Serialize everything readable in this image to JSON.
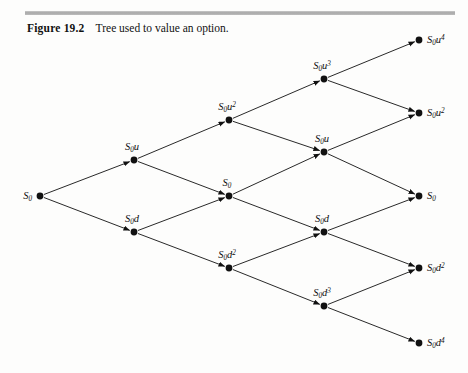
{
  "figure": {
    "label": "Figure 19.2",
    "caption": "Tree used to value an option.",
    "rule_color": "#b4b4b4",
    "background_color": "#fdfdfc",
    "ink_color": "#111111"
  },
  "diagram": {
    "type": "binomial-tree",
    "steps": 4,
    "recombining": true,
    "node_radius": 3.4,
    "arrowheads": true,
    "nodes": [
      {
        "id": "n0",
        "step": 0,
        "level": 0,
        "base": "S",
        "sub": "0",
        "exp": "",
        "label": "S0",
        "x": 40,
        "y": 196,
        "label_pos": "left"
      },
      {
        "id": "u1",
        "step": 1,
        "level": 1,
        "base": "S",
        "sub": "0",
        "exp": "u",
        "label": "S0u",
        "x": 134,
        "y": 160,
        "label_pos": "above"
      },
      {
        "id": "d1",
        "step": 1,
        "level": -1,
        "base": "S",
        "sub": "0",
        "exp": "d",
        "label": "S0d",
        "x": 134,
        "y": 232,
        "label_pos": "above"
      },
      {
        "id": "u2",
        "step": 2,
        "level": 2,
        "base": "S",
        "sub": "0",
        "exp": "u2",
        "label": "S0u2",
        "x": 229,
        "y": 120,
        "label_pos": "above"
      },
      {
        "id": "m2",
        "step": 2,
        "level": 0,
        "base": "S",
        "sub": "0",
        "exp": "",
        "label": "S0",
        "x": 229,
        "y": 196,
        "label_pos": "above"
      },
      {
        "id": "d2",
        "step": 2,
        "level": -2,
        "base": "S",
        "sub": "0",
        "exp": "d2",
        "label": "S0d2",
        "x": 229,
        "y": 268,
        "label_pos": "above"
      },
      {
        "id": "u3",
        "step": 3,
        "level": 3,
        "base": "S",
        "sub": "0",
        "exp": "u3",
        "label": "S0u3",
        "x": 324,
        "y": 79,
        "label_pos": "above"
      },
      {
        "id": "um3",
        "step": 3,
        "level": 1,
        "base": "S",
        "sub": "0",
        "exp": "u",
        "label": "S0u",
        "x": 324,
        "y": 152,
        "label_pos": "above"
      },
      {
        "id": "dm3",
        "step": 3,
        "level": -1,
        "base": "S",
        "sub": "0",
        "exp": "d",
        "label": "S0d",
        "x": 324,
        "y": 232,
        "label_pos": "above"
      },
      {
        "id": "d3",
        "step": 3,
        "level": -3,
        "base": "S",
        "sub": "0",
        "exp": "d3",
        "label": "S0d3",
        "x": 324,
        "y": 306,
        "label_pos": "above"
      },
      {
        "id": "t4u4",
        "step": 4,
        "level": 4,
        "base": "S",
        "sub": "0",
        "exp": "u4",
        "label": "S0u4",
        "x": 419,
        "y": 40,
        "label_pos": "right"
      },
      {
        "id": "t4u2",
        "step": 4,
        "level": 2,
        "base": "S",
        "sub": "0",
        "exp": "u2",
        "label": "S0u2",
        "x": 419,
        "y": 113,
        "label_pos": "right"
      },
      {
        "id": "t4m",
        "step": 4,
        "level": 0,
        "base": "S",
        "sub": "0",
        "exp": "",
        "label": "S0",
        "x": 419,
        "y": 196,
        "label_pos": "right"
      },
      {
        "id": "t4d2",
        "step": 4,
        "level": -2,
        "base": "S",
        "sub": "0",
        "exp": "d2",
        "label": "S0d2",
        "x": 419,
        "y": 268,
        "label_pos": "right"
      },
      {
        "id": "t4d4",
        "step": 4,
        "level": -4,
        "base": "S",
        "sub": "0",
        "exp": "d4",
        "label": "S0d4",
        "x": 419,
        "y": 343,
        "label_pos": "right"
      }
    ],
    "edges": [
      {
        "from": "n0",
        "to": "u1",
        "move": "up"
      },
      {
        "from": "n0",
        "to": "d1",
        "move": "down"
      },
      {
        "from": "u1",
        "to": "u2",
        "move": "up"
      },
      {
        "from": "u1",
        "to": "m2",
        "move": "down"
      },
      {
        "from": "d1",
        "to": "m2",
        "move": "up"
      },
      {
        "from": "d1",
        "to": "d2",
        "move": "down"
      },
      {
        "from": "u2",
        "to": "u3",
        "move": "up"
      },
      {
        "from": "u2",
        "to": "um3",
        "move": "down"
      },
      {
        "from": "m2",
        "to": "um3",
        "move": "up"
      },
      {
        "from": "m2",
        "to": "dm3",
        "move": "down"
      },
      {
        "from": "d2",
        "to": "dm3",
        "move": "up"
      },
      {
        "from": "d2",
        "to": "d3",
        "move": "down"
      },
      {
        "from": "u3",
        "to": "t4u4",
        "move": "up"
      },
      {
        "from": "u3",
        "to": "t4u2",
        "move": "down"
      },
      {
        "from": "um3",
        "to": "t4u2",
        "move": "up"
      },
      {
        "from": "um3",
        "to": "t4m",
        "move": "down"
      },
      {
        "from": "dm3",
        "to": "t4m",
        "move": "up"
      },
      {
        "from": "dm3",
        "to": "t4d2",
        "move": "down"
      },
      {
        "from": "d3",
        "to": "t4d2",
        "move": "up"
      },
      {
        "from": "d3",
        "to": "t4d4",
        "move": "down"
      }
    ]
  }
}
